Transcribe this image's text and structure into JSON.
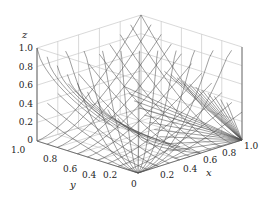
{
  "chart_data": {
    "type": "3d-line",
    "title": "",
    "axes": {
      "x": {
        "label": "x",
        "ticks": [
          "0",
          "0.2",
          "0.4",
          "0.6",
          "0.8",
          "1.0"
        ],
        "range": [
          0,
          1
        ]
      },
      "y": {
        "label": "y",
        "ticks": [
          "0",
          "0.2",
          "0.4",
          "0.6",
          "0.8",
          "1.0"
        ],
        "range": [
          0,
          1
        ]
      },
      "z": {
        "label": "z",
        "ticks": [
          "0",
          "0.2",
          "0.4",
          "0.6",
          "0.8",
          "1.0"
        ],
        "range": [
          0,
          1
        ]
      }
    },
    "grid": true,
    "legend": null,
    "line_color": "#333333",
    "grid_color": "#c8c8c8",
    "families": {
      "count_per_family": 11,
      "description": "Families of curves z = f(x,y) rising from origin corner, and lines fanning from corner (1,0,0)"
    }
  },
  "labels": {
    "z_axis": "z",
    "y_axis": "y",
    "x_axis": "x",
    "z_ticks": [
      "1.0",
      "0.8",
      "0.6",
      "0.4",
      "0.2",
      "0"
    ],
    "y_ticks": [
      "1.0",
      "0.8",
      "0.6",
      "0.4",
      "0.2"
    ],
    "x_ticks": [
      "0",
      "0.2",
      "0.4",
      "0.6",
      "0.8",
      "1.0"
    ]
  }
}
